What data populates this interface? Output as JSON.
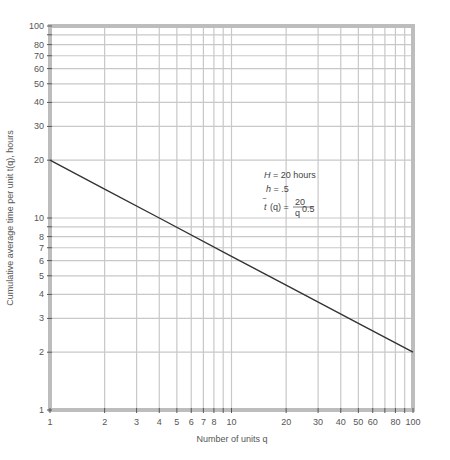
{
  "chart_data": {
    "type": "line",
    "scale": "log-log",
    "title": "",
    "xlabel": "Number of units q",
    "ylabel": "Cumulative average time per unit t̄(q), hours",
    "xlim": [
      1,
      100
    ],
    "ylim": [
      1,
      100
    ],
    "grid": true,
    "x_ticks": [
      1,
      2,
      3,
      4,
      5,
      6,
      7,
      8,
      10,
      20,
      30,
      40,
      50,
      60,
      80,
      100
    ],
    "x_grid": [
      1,
      2,
      3,
      4,
      5,
      6,
      7,
      8,
      9,
      10,
      20,
      30,
      40,
      50,
      60,
      70,
      80,
      90,
      100
    ],
    "y_ticks": [
      1,
      2,
      3,
      4,
      5,
      6,
      7,
      8,
      10,
      20,
      30,
      40,
      50,
      60,
      70,
      80,
      100
    ],
    "y_grid": [
      1,
      2,
      3,
      4,
      5,
      6,
      7,
      8,
      9,
      10,
      20,
      30,
      40,
      50,
      60,
      70,
      80,
      90,
      100
    ],
    "series": [
      {
        "name": "t̄(q) = 20 / q^0.5",
        "x": [
          1,
          2,
          4,
          10,
          20,
          50,
          100
        ],
        "values": [
          20,
          14.14,
          10,
          6.32,
          4.47,
          2.83,
          2
        ]
      }
    ],
    "annotations": [
      "H = 20 hours",
      "h = .5",
      "t̄(q) = 20 / q^0.5"
    ]
  },
  "annotation": {
    "line1_var": "H",
    "line1_rest": " = 20 hours",
    "line2_var": "h",
    "line2_rest": " = .5",
    "line3_lhs": "(q) =",
    "line3_num": "20",
    "line3_den": "q",
    "line3_exp": "0.5"
  },
  "labels": {
    "xlabel": "Number of units q",
    "ylabel_main": "Cumulative average time per unit ",
    "ylabel_tail": "(q), hours"
  }
}
